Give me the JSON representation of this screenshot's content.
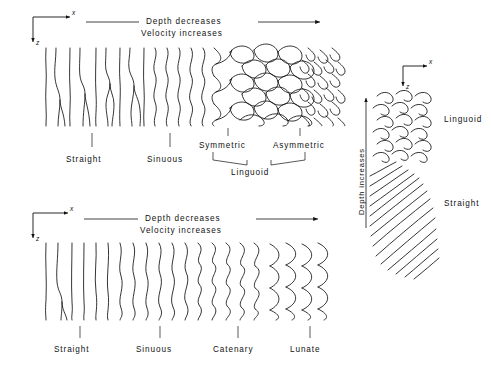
{
  "figure": {
    "ink_color": "#111111",
    "background": "#ffffff"
  },
  "panels": {
    "top": {
      "name": "plan-view-upper",
      "header": {
        "line1": "Depth  decreases",
        "line2": "Velocity  increases",
        "arrow_direction": "right"
      },
      "axes": {
        "x_label": "x",
        "x_direction": "right",
        "z_label": "z",
        "z_direction": "down"
      },
      "labels": [
        {
          "text": "Straight",
          "leader_x": 92
        },
        {
          "text": "Sinuous",
          "leader_x": 170
        },
        {
          "text": "Symmetric",
          "leader_x": 228
        },
        {
          "text": "Asymmetric",
          "leader_x": 300
        }
      ],
      "group_label": "Linguoid",
      "group_members": [
        "Symmetric",
        "Asymmetric"
      ]
    },
    "bottom": {
      "name": "plan-view-lower",
      "header": {
        "line1": "Depth  decreases",
        "line2": "Velocity  increases",
        "arrow_direction": "right"
      },
      "axes": {
        "x_label": "x",
        "x_direction": "right",
        "z_label": "z",
        "z_direction": "down"
      },
      "labels": [
        {
          "text": "Straight",
          "leader_x": 80
        },
        {
          "text": "Sinuous",
          "leader_x": 160
        },
        {
          "text": "Catenary",
          "leader_x": 238
        },
        {
          "text": "Lunate",
          "leader_x": 310
        }
      ]
    },
    "right": {
      "name": "plan-view-right",
      "axis_caption": "Depth  increases",
      "axis_caption_direction": "up",
      "axes": {
        "x_label": "x",
        "x_direction": "right",
        "z_label": "z",
        "z_direction": "down"
      },
      "labels": [
        {
          "text": "Linguoid",
          "y": 108
        },
        {
          "text": "Straight",
          "y": 190
        }
      ]
    }
  }
}
